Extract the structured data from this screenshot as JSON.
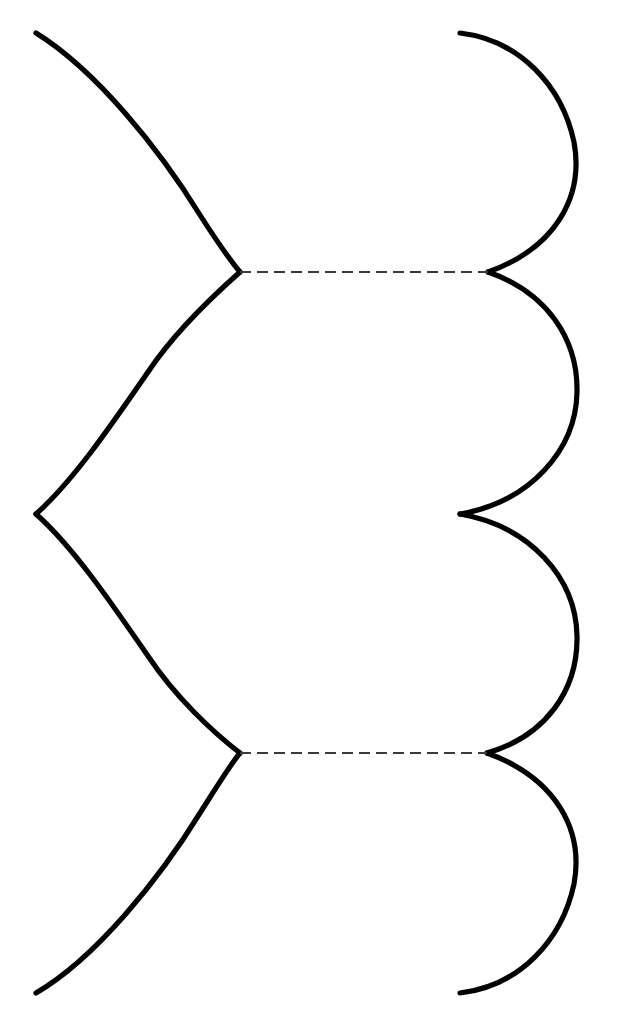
{
  "figure": {
    "background_color": "#ffffff",
    "width": 622,
    "height": 1033
  },
  "style": {
    "solid_color": "#000000",
    "solid_width": 5.2,
    "dashed_color": "#3a3a3a",
    "dashed_width": 2.1,
    "dash_pattern": "11 6"
  },
  "geometry": {
    "left_x": 36,
    "cusp_inner_x": 240,
    "right_arc_cusp_x_upper": 488,
    "right_arc_cusp_x_lower": 487,
    "right_arc_cusp_x_mid": 460,
    "right_max_x": 577,
    "top_y": 33,
    "bottom_y": 993,
    "dash_y_upper": 272,
    "dash_y_lower": 753,
    "mid_y": 514,
    "symmetry_axis_y": 513
  },
  "paths": {
    "left_curve_top": "M 36 33 C 96 70 160 150 200 215 C 216 240 230 260 240 272",
    "left_curve_upper_mid": "M 240 272 C 214 295 176 330 148 372 C 108 430 72 482 36 514",
    "left_curve_lower_mid": "M 36 514 C 72 546 108 598 148 656 C 176 698 214 733 240 753",
    "left_curve_bottom": "M 240 753 C 230 765 216 788 200 813 C 160 878 96 958 36 993",
    "right_lobe_1": "M 460 33 C 520 40 562 86 574 142 C 584 196 556 248 488 272",
    "right_lobe_2": "M 488 272 C 546 292 578 338 577 392 C 576 450 530 502 460 514",
    "right_lobe_3": "M 460 514 C 530 526 576 578 577 636 C 578 690 546 736 487 753",
    "right_lobe_4": "M 487 753 C 556 778 584 830 574 884 C 562 940 520 986 460 993",
    "dashed_upper": "M 240 272 L 488 272",
    "dashed_lower": "M 240 753 L 487 753"
  },
  "elements": {
    "left_curve_top_name": "left-s-curve-top",
    "left_curve_upper_mid_name": "left-s-curve-upper-middle",
    "left_curve_lower_mid_name": "left-s-curve-lower-middle",
    "left_curve_bottom_name": "left-s-curve-bottom",
    "right_lobe_1_name": "right-lobe-1",
    "right_lobe_2_name": "right-lobe-2",
    "right_lobe_3_name": "right-lobe-3",
    "right_lobe_4_name": "right-lobe-4",
    "dashed_upper_name": "dashed-connector-upper",
    "dashed_lower_name": "dashed-connector-lower"
  }
}
